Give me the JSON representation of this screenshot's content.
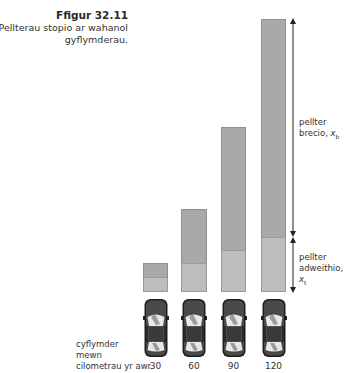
{
  "caption": {
    "figure_number": "Ffigur 32.11",
    "description_line1": "Pellterau stopio ar wahanol",
    "description_line2": "gyflymderau."
  },
  "labels": {
    "braking_line1": "pellter",
    "braking_line2": "brecio, ",
    "braking_symbol": "x",
    "braking_subscript": "b",
    "reaction_line1": "pellter",
    "reaction_line2": "adweithio, ",
    "reaction_symbol": "x",
    "reaction_subscript": "t",
    "speed_axis_line1": "cyflymder",
    "speed_axis_line2": "mewn",
    "speed_axis_line3": "cilometrau yr awr"
  },
  "colors": {
    "braking_bar": "#a9a9a9",
    "reaction_bar": "#bdbdbd",
    "car_body": "#3c3c3c",
    "arrow": "#222222"
  },
  "chart_data": {
    "type": "bar",
    "stacked": true,
    "title": "Pellterau stopio ar wahanol gyflymderau.",
    "xlabel": "cyflymder mewn cilometrau yr awr",
    "ylabel": "",
    "categories": [
      "30",
      "60",
      "90",
      "120"
    ],
    "series": [
      {
        "name": "pellter adweithio, x_t",
        "values": [
          15,
          29,
          42,
          55
        ]
      },
      {
        "name": "pellter brecio, x_b",
        "values": [
          14,
          54,
          123,
          218
        ]
      }
    ],
    "units": "relative pixel height",
    "grid": false,
    "legend": "annotated arrows on right"
  },
  "bars": [
    {
      "speed": "30",
      "left": 143,
      "width": 25,
      "top": 263,
      "divider": 277,
      "bottom": 292
    },
    {
      "speed": "60",
      "left": 181,
      "width": 26,
      "top": 209,
      "divider": 263,
      "bottom": 292
    },
    {
      "speed": "90",
      "left": 221,
      "width": 25,
      "top": 127,
      "divider": 250,
      "bottom": 292
    },
    {
      "speed": "120",
      "left": 261,
      "width": 25,
      "top": 19,
      "divider": 237,
      "bottom": 292
    }
  ]
}
